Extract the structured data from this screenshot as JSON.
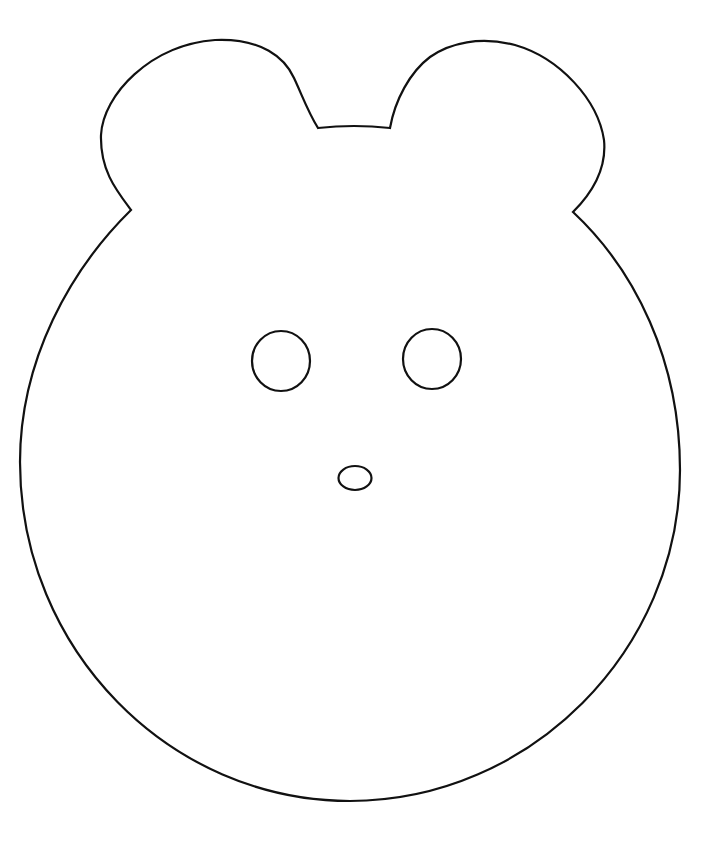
{
  "drawing": {
    "subject": "bear face outline",
    "stroke_color": "#111111",
    "background_color": "#ffffff",
    "parts": [
      "head",
      "left-ear",
      "right-ear",
      "left-eye",
      "right-eye",
      "nose"
    ]
  }
}
